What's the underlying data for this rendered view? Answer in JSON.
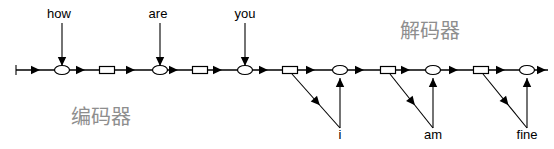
{
  "figure": {
    "type": "seq2seq-encoder-decoder-diagram",
    "width": 554,
    "height": 149,
    "background": "#ffffff",
    "line_color": "#000000",
    "section_label_color": "#8e8e8e"
  },
  "sections": {
    "encoder": {
      "label": "编码器",
      "x": 101,
      "y": 124
    },
    "decoder": {
      "label": "解码器",
      "x": 430,
      "y": 38
    }
  },
  "input_tokens": [
    {
      "text": "how",
      "label_x": 59,
      "label_y": 18,
      "arrow_x": 62,
      "arrow_top": 23,
      "arrow_bottom": 66
    },
    {
      "text": "are",
      "label_x": 158,
      "label_y": 18,
      "arrow_x": 160,
      "arrow_top": 23,
      "arrow_bottom": 66
    },
    {
      "text": "you",
      "label_x": 245,
      "label_y": 18,
      "arrow_x": 245,
      "arrow_top": 23,
      "arrow_bottom": 66
    }
  ],
  "output_tokens": [
    {
      "text": "i",
      "label_x": 340,
      "label_y": 139,
      "stem_x": 340,
      "stem_bottom": 128,
      "stem_top": 78,
      "src_x": 292,
      "src_y": 74
    },
    {
      "text": "am",
      "label_x": 433,
      "label_y": 139,
      "stem_x": 433,
      "stem_bottom": 128,
      "stem_top": 78,
      "src_x": 390,
      "src_y": 74
    },
    {
      "text": "fine",
      "label_x": 527,
      "label_y": 139,
      "stem_x": 527,
      "stem_bottom": 128,
      "stem_top": 78,
      "src_x": 483,
      "src_y": 74
    }
  ],
  "backbone": {
    "y": 70,
    "start_x": 16,
    "end_x": 548,
    "tick_height": 10
  },
  "nodes": [
    {
      "kind": "ellipse",
      "cx": 62,
      "cy": 70,
      "rx": 7.5,
      "ry": 4.5
    },
    {
      "kind": "rectangle",
      "cx": 107,
      "cy": 70,
      "w": 15,
      "h": 7
    },
    {
      "kind": "ellipse",
      "cx": 160,
      "cy": 70,
      "rx": 7.5,
      "ry": 4.5
    },
    {
      "kind": "rectangle",
      "cx": 200,
      "cy": 70,
      "w": 15,
      "h": 7
    },
    {
      "kind": "ellipse",
      "cx": 245,
      "cy": 70,
      "rx": 7.5,
      "ry": 4.5
    },
    {
      "kind": "rectangle",
      "cx": 290,
      "cy": 70,
      "w": 15,
      "h": 7
    },
    {
      "kind": "ellipse",
      "cx": 340,
      "cy": 70,
      "rx": 7.5,
      "ry": 4.5
    },
    {
      "kind": "rectangle",
      "cx": 388,
      "cy": 70,
      "w": 15,
      "h": 7
    },
    {
      "kind": "ellipse",
      "cx": 433,
      "cy": 70,
      "rx": 7.5,
      "ry": 4.5
    },
    {
      "kind": "rectangle",
      "cx": 481,
      "cy": 70,
      "w": 15,
      "h": 7
    },
    {
      "kind": "ellipse",
      "cx": 527,
      "cy": 70,
      "rx": 7.5,
      "ry": 4.5
    }
  ],
  "backbone_arrowheads": [
    {
      "x": 40
    },
    {
      "x": 85
    },
    {
      "x": 135
    },
    {
      "x": 178
    },
    {
      "x": 222
    },
    {
      "x": 268
    },
    {
      "x": 315
    },
    {
      "x": 364
    },
    {
      "x": 410
    },
    {
      "x": 458
    },
    {
      "x": 505
    },
    {
      "x": 546
    }
  ]
}
